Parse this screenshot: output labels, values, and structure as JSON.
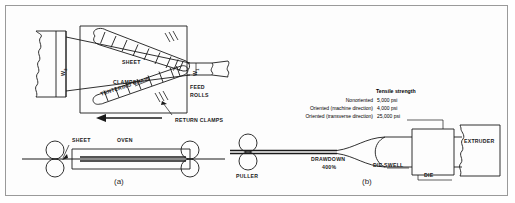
{
  "figure": {
    "background_color": "#ffffff",
    "border_color": "#9a9a9a",
    "line_color": "#1a1a1a"
  },
  "panel_a": {
    "caption": "(a)",
    "labels": {
      "sheet_top": "SHEET",
      "clamps": "CLAMPS",
      "tentering_chain": "TENTERING CHAIN",
      "return_clamps": "RETURN CLAMPS",
      "feed_rolls_line1": "FEED",
      "feed_rolls_line2": "ROLLS",
      "width_out": "W",
      "width_out_sub": "2",
      "width_in": "W",
      "width_in_sub": "1",
      "sheet_side": "SHEET",
      "oven": "OVEN"
    }
  },
  "panel_b": {
    "caption": "(b)",
    "labels": {
      "puller": "PULLER",
      "drawdown": "DRAWDOWN",
      "drawdown_value": "400%",
      "die_swell": "DIE SWELL",
      "die": "DIE",
      "extruder": "EXTRUDER"
    },
    "tensile_table": {
      "header": "Tensile strength",
      "rows": [
        {
          "name": "Nonoriented",
          "value": "5,000 psi"
        },
        {
          "name": "Oriented (machine direction)",
          "value": "4,000 psi"
        },
        {
          "name": "Oriented (transverse direction)",
          "value": "25,000 psi"
        }
      ]
    }
  }
}
